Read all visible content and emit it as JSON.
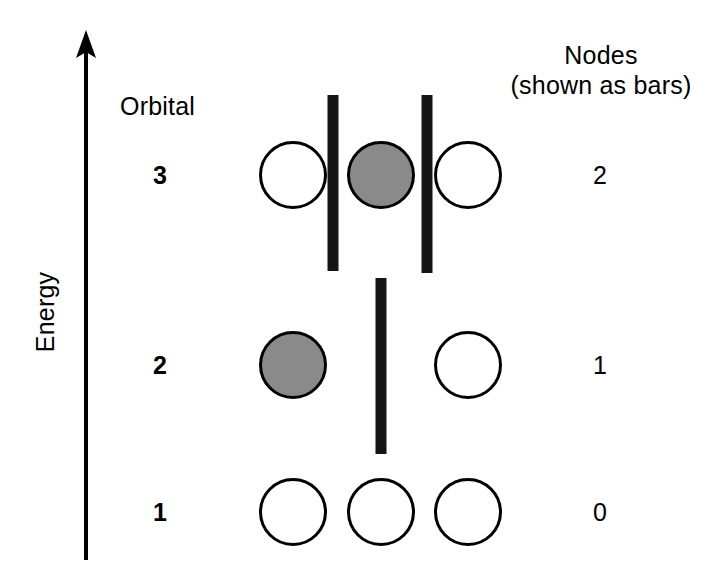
{
  "figure": {
    "axis": {
      "label": "Energy",
      "direction": "up",
      "arrow": true
    },
    "headers": {
      "orbital": "Orbital",
      "nodes_line1": "Nodes",
      "nodes_line2": "(shown as bars)"
    },
    "colors": {
      "stroke": "#000000",
      "bar": "#141414",
      "shaded_fill": "#8a8a8a",
      "empty_fill": "#ffffff",
      "background": "#ffffff"
    },
    "rows": [
      {
        "orbital": "3",
        "nodes": "2",
        "center_y": 175,
        "lobes": [
          {
            "cx": 293,
            "fill": "empty"
          },
          {
            "cx": 381,
            "fill": "shaded"
          },
          {
            "cx": 468,
            "fill": "empty"
          }
        ],
        "bars": [
          {
            "cx": 333,
            "top": 95,
            "height": 176,
            "width": 11
          },
          {
            "cx": 427,
            "top": 95,
            "height": 178,
            "width": 11
          }
        ]
      },
      {
        "orbital": "2",
        "nodes": "1",
        "center_y": 365,
        "lobes": [
          {
            "cx": 293,
            "fill": "shaded"
          },
          {
            "cx": 468,
            "fill": "empty"
          }
        ],
        "bars": [
          {
            "cx": 381,
            "top": 278,
            "height": 176,
            "width": 11
          }
        ]
      },
      {
        "orbital": "1",
        "nodes": "0",
        "center_y": 512,
        "lobes": [
          {
            "cx": 293,
            "fill": "empty"
          },
          {
            "cx": 381,
            "fill": "empty"
          },
          {
            "cx": 468,
            "fill": "empty"
          }
        ],
        "bars": []
      }
    ],
    "label_columns": {
      "orbital_x": 160,
      "nodes_x": 600
    }
  },
  "chart_data": {
    "type": "diagram",
    "xlabel": "",
    "ylabel": "Energy",
    "categories": [
      "1",
      "2",
      "3"
    ],
    "series": [
      {
        "name": "Nodes",
        "values": [
          0,
          1,
          2
        ]
      }
    ]
  }
}
